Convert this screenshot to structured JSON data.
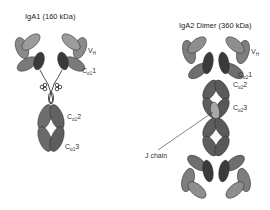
{
  "diagram": {
    "type": "antibody-structure",
    "colors": {
      "heavy_dark": "#5a5a5a",
      "heavy_mid": "#6e6e6e",
      "light_mid": "#8a8a8a",
      "light_light": "#9c9c9c",
      "variable_dark": "#3a3a3a",
      "j_chain": "#a8a8a8",
      "outline": "#2a2a2a",
      "background": "#ffffff"
    },
    "iga1": {
      "title": "IgA1 (160 kDa)",
      "labels": {
        "vh_main": "V",
        "vh_sub": "H",
        "ch1_main": "C",
        "ch1_sub": "α1",
        "ch1_num": "1",
        "ch2_main": "C",
        "ch2_sub": "α1",
        "ch2_num": "2",
        "ch3_main": "C",
        "ch3_sub": "α1",
        "ch3_num": "3"
      }
    },
    "iga2": {
      "title": "IgA2 Dimer (360 kDa)",
      "labels": {
        "vh_main": "V",
        "vh_sub": "H",
        "ch1_main": "C",
        "ch1_sub": "α2",
        "ch1_num": "1",
        "ch2_main": "C",
        "ch2_sub": "α2",
        "ch2_num": "2",
        "ch3_main": "C",
        "ch3_sub": "α2",
        "ch3_num": "3",
        "j_chain": "J chain"
      }
    }
  }
}
